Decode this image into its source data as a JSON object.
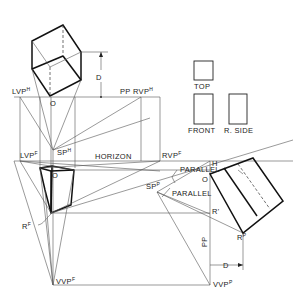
{
  "diagram": {
    "type": "perspective-projection-technical-drawing",
    "labels": {
      "lvp_h": "LVP",
      "lvp_h_sup": "H",
      "rvp_h": "RVP",
      "rvp_h_sup": "H",
      "pp_top": "PP",
      "d_top": "D",
      "o_top": "O",
      "sp_h": "SP",
      "sp_h_sup": "H",
      "horizon": "HORIZON",
      "lvp_f": "LVP",
      "lvp_f_sup": "F",
      "rvp_f": "RVP",
      "rvp_f_sup": "F",
      "o_front": "O",
      "r_f": "R",
      "r_f_sup": "F",
      "vvp_f": "VVP",
      "vvp_f_sup": "F",
      "parallel_top": "PARALLEL",
      "parallel_mid": "PARALLEL",
      "h_right": "H",
      "o_right": "O",
      "sp_p": "SP",
      "sp_p_sup": "P",
      "r_prime": "R'",
      "r_p": "R",
      "r_p_sup": "P",
      "pp_right": "PP",
      "d_right": "D",
      "vvp_p": "VVP",
      "vvp_p_sup": "P",
      "view_top": "TOP",
      "view_front": "FRONT",
      "view_rside": "R. SIDE"
    },
    "colors": {
      "line": "#111111",
      "construction": "#555555",
      "background": "#ffffff"
    }
  }
}
